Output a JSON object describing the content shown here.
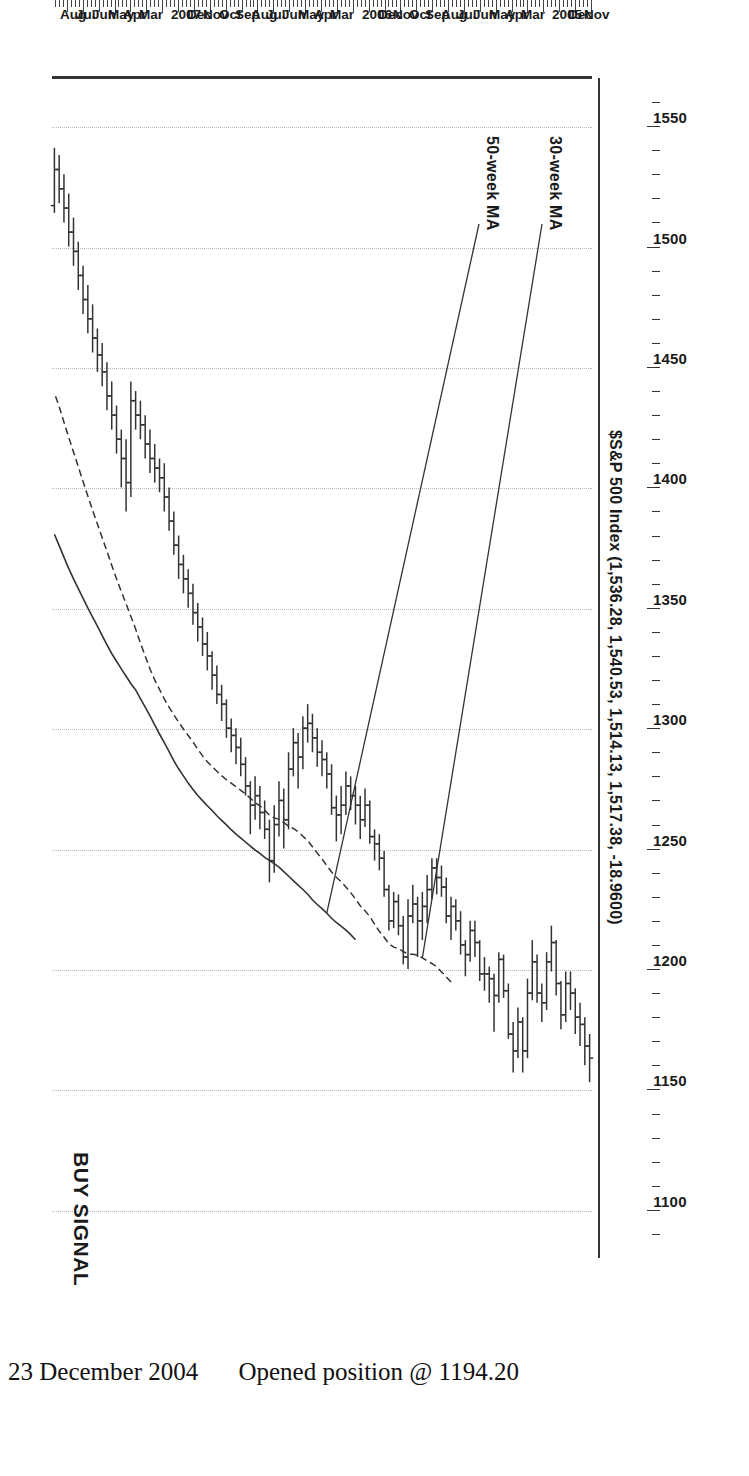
{
  "chart_data": {
    "type": "ohlc",
    "title": "$S&P 500 Index (1,536.28, 1,540.53, 1,514.13, 1,517.38, -18.9600)",
    "quote": {
      "open": 1536.28,
      "high": 1540.53,
      "low": 1514.13,
      "close": 1517.38,
      "change": -18.96
    },
    "xlabel": "",
    "ylabel": "",
    "ylim": [
      1080,
      1570
    ],
    "grid": true,
    "orientation": "rotated-90",
    "price_ticks": [
      1550,
      1500,
      1450,
      1400,
      1350,
      1300,
      1250,
      1200,
      1150,
      1100
    ],
    "time_ticks": [
      "Nov",
      "Dec",
      "2005",
      "",
      "Mar",
      "Apr",
      "May",
      "Jun",
      "Jul",
      "Aug",
      "Sep",
      "Oct",
      "Nov",
      "Dec",
      "2006",
      "",
      "Mar",
      "Apr",
      "May",
      "Jun",
      "Jul",
      "Aug",
      "Sep",
      "Oct",
      "Nov",
      "Dec",
      "2007",
      "",
      "Mar",
      "Apr",
      "May",
      "Jun",
      "Jul",
      "Aug"
    ],
    "annotations": [
      {
        "name": "ma30",
        "text": "30-week MA"
      },
      {
        "name": "ma50",
        "text": "50-week MA"
      },
      {
        "name": "buy",
        "text": "BUY SIGNAL"
      }
    ],
    "series": [
      {
        "name": "30-week MA",
        "style": "dashed"
      },
      {
        "name": "50-week MA",
        "style": "solid"
      }
    ],
    "bars": [
      [
        1163,
        1173,
        1153,
        1168
      ],
      [
        1168,
        1180,
        1160,
        1177
      ],
      [
        1177,
        1186,
        1168,
        1180
      ],
      [
        1180,
        1192,
        1173,
        1190
      ],
      [
        1190,
        1199,
        1183,
        1194
      ],
      [
        1194,
        1199,
        1178,
        1181
      ],
      [
        1181,
        1195,
        1175,
        1194
      ],
      [
        1194,
        1212,
        1189,
        1211
      ],
      [
        1211,
        1218,
        1199,
        1203
      ],
      [
        1203,
        1207,
        1183,
        1186
      ],
      [
        1186,
        1194,
        1178,
        1190
      ],
      [
        1190,
        1206,
        1186,
        1203
      ],
      [
        1203,
        1212,
        1187,
        1190
      ],
      [
        1190,
        1196,
        1163,
        1166
      ],
      [
        1166,
        1180,
        1157,
        1178
      ],
      [
        1178,
        1184,
        1163,
        1166
      ],
      [
        1166,
        1178,
        1157,
        1173
      ],
      [
        1173,
        1194,
        1171,
        1191
      ],
      [
        1191,
        1206,
        1188,
        1204
      ],
      [
        1204,
        1207,
        1186,
        1189
      ],
      [
        1189,
        1198,
        1174,
        1196
      ],
      [
        1196,
        1201,
        1186,
        1198
      ],
      [
        1198,
        1205,
        1191,
        1198
      ],
      [
        1198,
        1212,
        1195,
        1211
      ],
      [
        1211,
        1220,
        1205,
        1216
      ],
      [
        1216,
        1220,
        1203,
        1206
      ],
      [
        1206,
        1212,
        1197,
        1210
      ],
      [
        1210,
        1224,
        1206,
        1220
      ],
      [
        1220,
        1229,
        1216,
        1226
      ],
      [
        1226,
        1230,
        1212,
        1222
      ],
      [
        1222,
        1238,
        1219,
        1234
      ],
      [
        1234,
        1243,
        1230,
        1238
      ],
      [
        1238,
        1246,
        1231,
        1242
      ],
      [
        1242,
        1246,
        1229,
        1233
      ],
      [
        1233,
        1239,
        1219,
        1226
      ],
      [
        1226,
        1232,
        1212,
        1220
      ],
      [
        1220,
        1230,
        1205,
        1227
      ],
      [
        1227,
        1235,
        1219,
        1222
      ],
      [
        1222,
        1229,
        1200,
        1205
      ],
      [
        1205,
        1222,
        1202,
        1218
      ],
      [
        1218,
        1231,
        1214,
        1228
      ],
      [
        1228,
        1232,
        1217,
        1220
      ],
      [
        1220,
        1235,
        1216,
        1233
      ],
      [
        1233,
        1249,
        1230,
        1246
      ],
      [
        1246,
        1256,
        1241,
        1252
      ],
      [
        1252,
        1258,
        1245,
        1255
      ],
      [
        1255,
        1270,
        1252,
        1268
      ],
      [
        1268,
        1275,
        1259,
        1262
      ],
      [
        1262,
        1272,
        1254,
        1268
      ],
      [
        1268,
        1276,
        1260,
        1272
      ],
      [
        1272,
        1280,
        1266,
        1276
      ],
      [
        1276,
        1282,
        1264,
        1268
      ],
      [
        1268,
        1276,
        1256,
        1264
      ],
      [
        1264,
        1272,
        1253,
        1267
      ],
      [
        1267,
        1285,
        1264,
        1281
      ],
      [
        1281,
        1290,
        1275,
        1287
      ],
      [
        1287,
        1295,
        1280,
        1290
      ],
      [
        1290,
        1300,
        1284,
        1296
      ],
      [
        1296,
        1306,
        1290,
        1302
      ],
      [
        1302,
        1310,
        1294,
        1300
      ],
      [
        1300,
        1305,
        1283,
        1288
      ],
      [
        1288,
        1298,
        1275,
        1294
      ],
      [
        1294,
        1300,
        1280,
        1283
      ],
      [
        1283,
        1290,
        1258,
        1262
      ],
      [
        1262,
        1275,
        1250,
        1270
      ],
      [
        1270,
        1278,
        1255,
        1260
      ],
      [
        1260,
        1268,
        1240,
        1245
      ],
      [
        1245,
        1262,
        1236,
        1258
      ],
      [
        1258,
        1270,
        1254,
        1265
      ],
      [
        1265,
        1276,
        1258,
        1272
      ],
      [
        1272,
        1280,
        1262,
        1268
      ],
      [
        1268,
        1278,
        1256,
        1276
      ],
      [
        1276,
        1288,
        1272,
        1285
      ],
      [
        1285,
        1296,
        1280,
        1292
      ],
      [
        1292,
        1300,
        1285,
        1297
      ],
      [
        1297,
        1304,
        1290,
        1300
      ],
      [
        1300,
        1312,
        1296,
        1310
      ],
      [
        1310,
        1318,
        1303,
        1314
      ],
      [
        1314,
        1326,
        1310,
        1322
      ],
      [
        1322,
        1332,
        1316,
        1330
      ],
      [
        1330,
        1340,
        1324,
        1335
      ],
      [
        1335,
        1346,
        1330,
        1342
      ],
      [
        1342,
        1352,
        1336,
        1348
      ],
      [
        1348,
        1360,
        1343,
        1356
      ],
      [
        1356,
        1366,
        1350,
        1362
      ],
      [
        1362,
        1372,
        1356,
        1368
      ],
      [
        1368,
        1380,
        1362,
        1376
      ],
      [
        1376,
        1390,
        1372,
        1386
      ],
      [
        1386,
        1400,
        1382,
        1396
      ],
      [
        1396,
        1410,
        1390,
        1404
      ],
      [
        1404,
        1412,
        1398,
        1408
      ],
      [
        1408,
        1418,
        1402,
        1412
      ],
      [
        1412,
        1424,
        1406,
        1418
      ],
      [
        1418,
        1430,
        1412,
        1426
      ],
      [
        1426,
        1436,
        1420,
        1430
      ],
      [
        1430,
        1440,
        1424,
        1436
      ],
      [
        1436,
        1444,
        1396,
        1402
      ],
      [
        1402,
        1420,
        1390,
        1412
      ],
      [
        1412,
        1424,
        1400,
        1420
      ],
      [
        1420,
        1434,
        1414,
        1430
      ],
      [
        1430,
        1444,
        1424,
        1438
      ],
      [
        1438,
        1452,
        1432,
        1448
      ],
      [
        1448,
        1460,
        1442,
        1455
      ],
      [
        1455,
        1466,
        1448,
        1462
      ],
      [
        1462,
        1476,
        1456,
        1470
      ],
      [
        1470,
        1484,
        1464,
        1478
      ],
      [
        1478,
        1492,
        1472,
        1488
      ],
      [
        1488,
        1502,
        1482,
        1498
      ],
      [
        1498,
        1512,
        1492,
        1506
      ],
      [
        1506,
        1522,
        1500,
        1516
      ],
      [
        1516,
        1530,
        1510,
        1524
      ],
      [
        1524,
        1538,
        1518,
        1532
      ],
      [
        1532,
        1541,
        1514,
        1517
      ]
    ]
  },
  "caption": {
    "date": "23 December 2004",
    "note": "Opened position @ 1194.20"
  }
}
